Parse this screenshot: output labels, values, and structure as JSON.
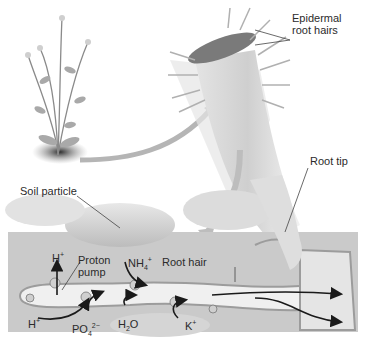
{
  "diagram": {
    "colors": {
      "background": "#ffffff",
      "soil_region": "#c9c9c9",
      "soil_particle": "#d6d6d6",
      "root_surface": "#bdbdbd",
      "cell_interior": "#eeeeee",
      "arrow": "#1a1a1a",
      "label_text": "#2b2b2b"
    },
    "labels": {
      "epidermal_root_hairs_line1": "Epidermal",
      "epidermal_root_hairs_line2": "root hairs",
      "root_tip": "Root tip",
      "soil_particle": "Soil particle",
      "proton_pump_line1": "Proton",
      "proton_pump_line2": "pump",
      "root_hair": "Root hair"
    },
    "ions": {
      "h_plus_out": {
        "base": "H",
        "sup": "+"
      },
      "h_plus_in": {
        "base": "H",
        "sup": "+"
      },
      "nh4": {
        "base": "NH",
        "sub": "4",
        "sup": "+"
      },
      "po4": {
        "base": "PO",
        "sub": "4",
        "sup": "2−"
      },
      "h2o": {
        "base": "H",
        "sub": "2",
        "tail": "O"
      },
      "k_plus": {
        "base": "K",
        "sup": "+"
      }
    },
    "panels": [
      {
        "name": "whole-plant",
        "description": "Flowering plant with rosette at soil"
      },
      {
        "name": "root-section",
        "description": "Root segment covered with epidermal root hairs"
      },
      {
        "name": "soil-cross-section",
        "description": "Root hair among soil particles with ion transport"
      }
    ]
  }
}
